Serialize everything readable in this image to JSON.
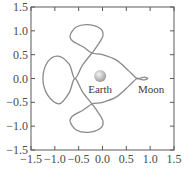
{
  "chart_data": {
    "type": "line",
    "title": "",
    "xlabel": "",
    "ylabel": "",
    "xlim": [
      -1.5,
      1.5
    ],
    "ylim": [
      -1.5,
      1.5
    ],
    "grid": false,
    "legend": null,
    "x_ticks": [
      "−1.5",
      "−1.0",
      "−0.5",
      "0.0",
      "0.5",
      "1.0",
      "1.5"
    ],
    "x_tick_values": [
      -1.5,
      -1.0,
      -0.5,
      0.0,
      0.5,
      1.0,
      1.5
    ],
    "y_ticks": [
      "1.5",
      "1.0",
      "0.5",
      "0.0",
      "−0.5",
      "−1.0",
      "−1.5"
    ],
    "y_tick_values": [
      1.5,
      1.0,
      0.5,
      0.0,
      -0.5,
      -1.0,
      -1.5
    ],
    "series": [
      {
        "name": "trajectory",
        "description": "Three-body periodic orbit with lobes around Earth and a small loop near Moon",
        "points": [
          [
            0.95,
            0.0
          ],
          [
            0.88,
            0.03
          ],
          [
            0.8,
            0.01
          ],
          [
            0.72,
            0.0
          ],
          [
            0.55,
            0.16
          ],
          [
            0.3,
            0.38
          ],
          [
            0.0,
            0.5
          ],
          [
            -0.22,
            0.535
          ],
          [
            -0.4,
            0.66
          ],
          [
            -0.62,
            0.78
          ],
          [
            -0.68,
            0.9
          ],
          [
            -0.55,
            1.08
          ],
          [
            -0.3,
            1.13
          ],
          [
            -0.05,
            1.05
          ],
          [
            0.01,
            0.9
          ],
          [
            -0.1,
            0.7
          ],
          [
            -0.22,
            0.535
          ],
          [
            -0.42,
            0.28
          ],
          [
            -0.58,
            0.0
          ],
          [
            -0.7,
            0.3
          ],
          [
            -0.93,
            0.47
          ],
          [
            -1.15,
            0.35
          ],
          [
            -1.25,
            0.0
          ],
          [
            -1.15,
            -0.35
          ],
          [
            -0.91,
            -0.53
          ],
          [
            -0.7,
            -0.3
          ],
          [
            -0.58,
            0.0
          ],
          [
            -0.42,
            -0.28
          ],
          [
            -0.22,
            -0.535
          ],
          [
            -0.1,
            -0.7
          ],
          [
            0.01,
            -0.9
          ],
          [
            -0.05,
            -1.05
          ],
          [
            -0.3,
            -1.13
          ],
          [
            -0.55,
            -1.08
          ],
          [
            -0.68,
            -0.9
          ],
          [
            -0.62,
            -0.78
          ],
          [
            -0.4,
            -0.66
          ],
          [
            -0.22,
            -0.535
          ],
          [
            0.0,
            -0.5
          ],
          [
            0.3,
            -0.38
          ],
          [
            0.55,
            -0.16
          ],
          [
            0.72,
            0.0
          ],
          [
            0.8,
            -0.02
          ],
          [
            0.88,
            -0.03
          ],
          [
            0.95,
            0.0
          ]
        ],
        "color": "#8a8a8a"
      }
    ],
    "annotations": [
      {
        "text": "Earth",
        "x": -0.05,
        "y": -0.22,
        "marker": "sphere",
        "marker_x": -0.05,
        "marker_y": 0.05
      },
      {
        "text": "Moon",
        "x": 1.02,
        "y": -0.22,
        "marker": "none"
      }
    ]
  },
  "labels": {
    "earth": "Earth",
    "moon": "Moon"
  },
  "colors": {
    "axis": "#5a5a5a",
    "curve": "#8a8a8a",
    "earth_light": "#f4f4f4",
    "earth_dark": "#9c9c9c"
  }
}
